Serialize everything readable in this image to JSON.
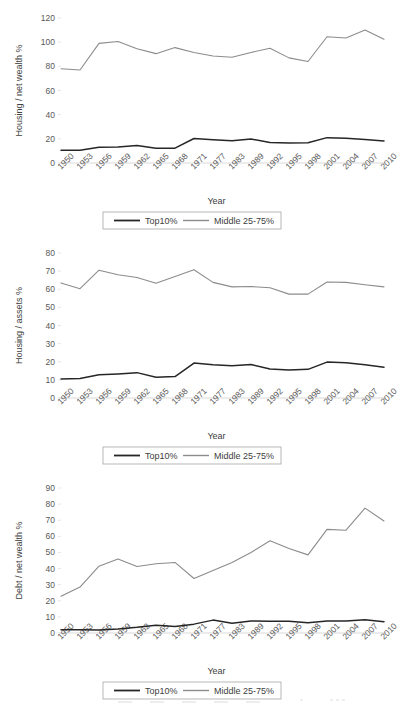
{
  "figure": {
    "series_names": [
      "Top10%",
      "Middle 25-75%"
    ],
    "colors": {
      "top10": "#262626",
      "middle": "#8c8c8c",
      "axis": "#d9d9d9",
      "text": "#595959"
    },
    "xlabel": "Year",
    "legend": {
      "top10_label": "Top10%",
      "middle_label": "Middle 25-75%"
    }
  },
  "chart_data": [
    {
      "type": "line",
      "title": "",
      "xlabel": "Year",
      "ylabel": "Housing / net wealth %",
      "ylim": [
        0,
        120
      ],
      "yticks": [
        0,
        20,
        40,
        60,
        80,
        100,
        120
      ],
      "grid": false,
      "legend_position": "bottom",
      "categories": [
        "1950",
        "1953",
        "1956",
        "1959",
        "1962",
        "1965",
        "1968",
        "1971",
        "1977",
        "1983",
        "1989",
        "1992",
        "1995",
        "1998",
        "2001",
        "2004",
        "2007",
        "2010"
      ],
      "series": [
        {
          "name": "Top10%",
          "values": [
            10.5,
            10.5,
            13.0,
            13.3,
            14.5,
            12.3,
            12.3,
            20.3,
            19.3,
            18.5,
            19.8,
            17.0,
            16.5,
            16.8,
            21.0,
            20.5,
            19.5,
            18.3
          ]
        },
        {
          "name": "Middle 25-75%",
          "values": [
            78.0,
            77.0,
            99.0,
            100.5,
            94.5,
            90.5,
            95.5,
            91.5,
            88.5,
            87.5,
            91.5,
            95.0,
            87.0,
            84.0,
            104.5,
            103.5,
            110.0,
            102.5
          ]
        }
      ]
    },
    {
      "type": "line",
      "title": "",
      "xlabel": "Year",
      "ylabel": "Housing / assets %",
      "ylim": [
        0,
        80
      ],
      "yticks": [
        0,
        10,
        20,
        30,
        40,
        50,
        60,
        70,
        80
      ],
      "grid": false,
      "legend_position": "bottom",
      "categories": [
        "1950",
        "1953",
        "1956",
        "1959",
        "1962",
        "1965",
        "1968",
        "1971",
        "1977",
        "1983",
        "1989",
        "1992",
        "1995",
        "1998",
        "2001",
        "2004",
        "2007",
        "2010"
      ],
      "series": [
        {
          "name": "Top10%",
          "values": [
            10.5,
            10.8,
            12.8,
            13.3,
            14.0,
            11.5,
            11.8,
            19.3,
            18.3,
            17.8,
            18.5,
            16.0,
            15.5,
            15.8,
            19.8,
            19.5,
            18.3,
            17.0
          ]
        },
        {
          "name": "Middle 25-75%",
          "values": [
            63.5,
            60.3,
            70.5,
            68.0,
            66.5,
            63.3,
            67.0,
            70.8,
            63.8,
            61.3,
            61.5,
            60.8,
            57.3,
            57.3,
            64.0,
            63.8,
            62.5,
            61.3
          ]
        }
      ]
    },
    {
      "type": "line",
      "title": "",
      "xlabel": "Year",
      "ylabel": "Debt / net wealth %",
      "ylim": [
        0,
        90
      ],
      "yticks": [
        0,
        10,
        20,
        30,
        40,
        50,
        60,
        70,
        80,
        90
      ],
      "grid": false,
      "legend_position": "bottom",
      "categories": [
        "1950",
        "1953",
        "1956",
        "1959",
        "1962",
        "1965",
        "1968",
        "1971",
        "1977",
        "1983",
        "1989",
        "1992",
        "1995",
        "1998",
        "2001",
        "2004",
        "2007",
        "2010"
      ],
      "series": [
        {
          "name": "Top10%",
          "values": [
            2.0,
            2.0,
            1.8,
            2.5,
            3.5,
            4.8,
            4.0,
            5.5,
            8.0,
            6.0,
            7.5,
            7.3,
            7.3,
            6.3,
            7.5,
            7.5,
            8.3,
            7.0
          ]
        },
        {
          "name": "Middle 25-75%",
          "values": [
            22.8,
            28.5,
            41.5,
            46.0,
            41.3,
            43.0,
            43.8,
            33.8,
            38.8,
            43.8,
            50.0,
            57.3,
            52.5,
            48.5,
            64.3,
            63.8,
            77.5,
            69.5
          ]
        }
      ]
    }
  ]
}
